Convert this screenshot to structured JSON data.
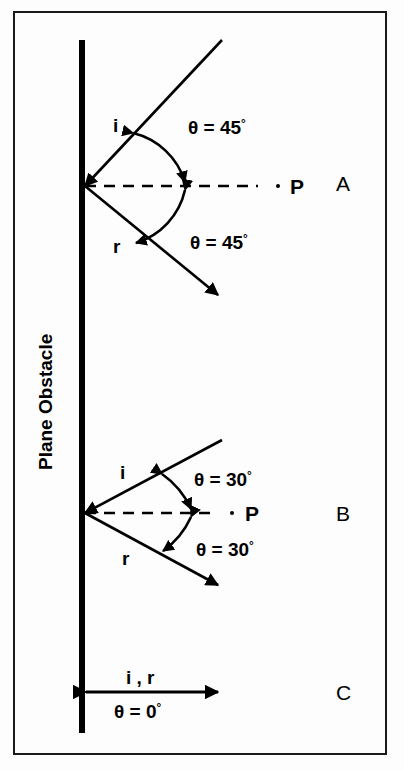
{
  "figure": {
    "obstacle_label": "Plane Obstacle",
    "colors": {
      "ink": "#000000",
      "frame": "#1a1a1a",
      "background": "#fdfdfd"
    }
  },
  "panels": [
    {
      "id": "A",
      "letter": "A",
      "incident_label": "i",
      "reflected_label": "r",
      "normal_label": "P",
      "angle_incidence_text": "θ = 45",
      "angle_incidence_degree": "°",
      "angle_reflection_text": "θ = 45",
      "angle_reflection_degree": "°",
      "angle_value": 45
    },
    {
      "id": "B",
      "letter": "B",
      "incident_label": "i",
      "reflected_label": "r",
      "normal_label": "P",
      "angle_incidence_text": "θ = 30",
      "angle_incidence_degree": "°",
      "angle_reflection_text": "θ = 30",
      "angle_reflection_degree": "°",
      "angle_value": 30
    },
    {
      "id": "C",
      "letter": "C",
      "ray_label": "i , r",
      "angle_text": "θ = 0",
      "angle_degree": "°",
      "angle_value": 0
    }
  ]
}
